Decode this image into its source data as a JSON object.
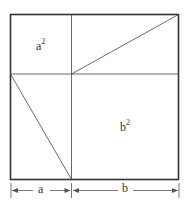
{
  "diagram": {
    "labels": {
      "a_squared_base": "a",
      "a_squared_exp": "2",
      "b_squared_base": "b",
      "b_squared_exp": "2",
      "dim_a": "a",
      "dim_b": "b"
    },
    "colors": {
      "line": "#333333",
      "background": "#ffffff"
    }
  }
}
